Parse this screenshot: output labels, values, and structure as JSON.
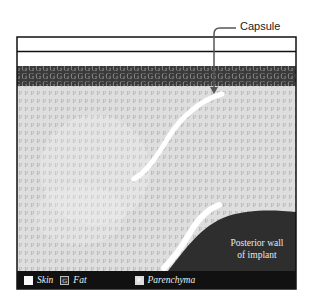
{
  "figure": {
    "callout": {
      "label": "Capsule"
    },
    "layers": [
      {
        "name": "Skin",
        "letter": "",
        "color": "#ffffff"
      },
      {
        "name": "Fat",
        "letter": "G",
        "color": "#3a3a3a"
      },
      {
        "name": "Parenchyma",
        "letter": "P",
        "color": "#dcdcdc"
      }
    ],
    "implant": {
      "line1": "Posterior wall",
      "line2": "of implant",
      "color": "#2e2e2e"
    }
  },
  "legend": {
    "items": [
      {
        "swatch": "",
        "label": "Skin"
      },
      {
        "swatch": "G",
        "label": "Fat"
      },
      {
        "swatch": "P",
        "label": "Parenchyma"
      }
    ]
  }
}
